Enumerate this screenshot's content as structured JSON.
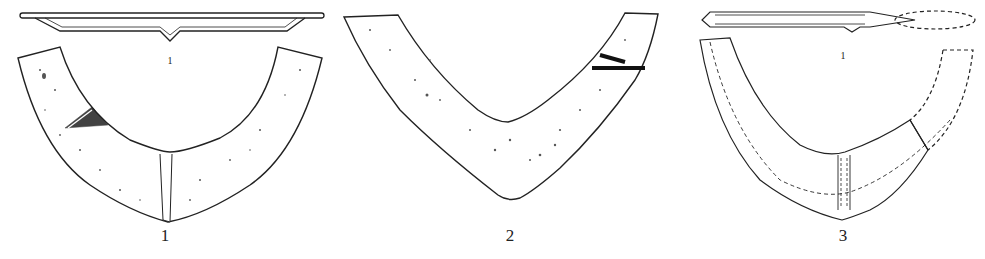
{
  "figure": {
    "items": [
      {
        "id": "fig-1",
        "number_label": "1",
        "section_label": "1",
        "has_section": true
      },
      {
        "id": "fig-2",
        "number_label": "2",
        "has_section": false
      },
      {
        "id": "fig-3",
        "number_label": "3",
        "section_label": "1",
        "has_section": true
      }
    ],
    "colors": {
      "line": "#222222",
      "background": "#ffffff",
      "stipple": "#555555"
    }
  }
}
